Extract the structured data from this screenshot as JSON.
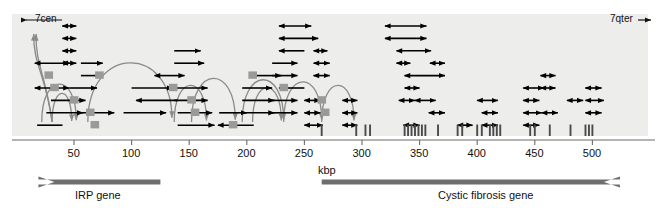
{
  "figure": {
    "panel": {
      "background_color": "#ededec",
      "x": 12,
      "y": 14,
      "width": 636,
      "height": 122
    },
    "orientation_labels": {
      "left": {
        "text": "7cen",
        "arrow": "left-arrow-icon"
      },
      "right": {
        "text": "7qter",
        "arrow": "right-arrow-icon"
      }
    },
    "axis": {
      "label": "kbp",
      "ticks": [
        50,
        100,
        150,
        200,
        250,
        300,
        350,
        400,
        450,
        500
      ],
      "tick_labels": [
        "50",
        "100",
        "150",
        "200",
        "250",
        "300",
        "350",
        "400",
        "450",
        "500"
      ],
      "range_kbp": [
        14,
        515
      ],
      "px_per_kbp": 1.152,
      "origin_px": 16.4,
      "line_color": "#6b6b6b",
      "y_px": 140
    },
    "genes": [
      {
        "name": "IRP gene",
        "label": "IRP gene",
        "direction": "left",
        "start_kbp": 33,
        "end_kbp": 125,
        "color": "#6e6e6e"
      },
      {
        "name": "Cystic fibrosis gene",
        "label": "Cystic fibrosis gene",
        "direction": "right",
        "start_kbp": 265,
        "end_kbp": 510,
        "color": "#6e6e6e"
      }
    ],
    "colors": {
      "clone_arrow": "#000000",
      "walk_arc": "#8a8a8a",
      "probe_box": "#9a9a9a",
      "exon_tick": "#4a4a4a",
      "panel_bg": "#ededec",
      "axis_line": "#6b6b6b",
      "gene_bar": "#6e6e6e"
    },
    "legend_semantics": {
      "clone_arrow": "cloned genomic fragment (double-headed arrow)",
      "walk_arc": "chromosome walk / jump step",
      "probe_box": "hybridization probe position",
      "exon_tick": "CFTR exon position"
    },
    "exon_ticks_kbp": [
      265,
      295,
      303,
      307,
      337,
      340,
      343,
      346,
      349,
      352,
      355,
      366,
      383,
      387,
      400,
      404,
      411,
      414,
      417,
      420,
      446,
      450,
      463,
      481,
      494,
      497,
      500
    ],
    "clones": [
      {
        "start_kbp": 16,
        "end_kbp": 46,
        "row": 3,
        "heads": "both"
      },
      {
        "start_kbp": 40,
        "end_kbp": 52,
        "row": 0,
        "heads": "both"
      },
      {
        "start_kbp": 40,
        "end_kbp": 52,
        "row": 1,
        "heads": "both"
      },
      {
        "start_kbp": 40,
        "end_kbp": 52,
        "row": 2,
        "heads": "both"
      },
      {
        "start_kbp": 40,
        "end_kbp": 52,
        "row": 3,
        "heads": "both"
      },
      {
        "start_kbp": 56,
        "end_kbp": 75,
        "row": 3,
        "heads": "right"
      },
      {
        "start_kbp": 56,
        "end_kbp": 75,
        "row": 4,
        "heads": "right"
      },
      {
        "start_kbp": 16,
        "end_kbp": 46,
        "row": 5,
        "heads": "both"
      },
      {
        "start_kbp": 46,
        "end_kbp": 70,
        "row": 5,
        "heads": "right"
      },
      {
        "start_kbp": 30,
        "end_kbp": 60,
        "row": 6,
        "heads": "right"
      },
      {
        "start_kbp": 26,
        "end_kbp": 58,
        "row": 7,
        "heads": "right"
      },
      {
        "start_kbp": 56,
        "end_kbp": 85,
        "row": 7,
        "heads": "right"
      },
      {
        "start_kbp": 18,
        "end_kbp": 40,
        "row": 8,
        "heads": "none"
      },
      {
        "start_kbp": 120,
        "end_kbp": 146,
        "row": 4,
        "heads": "both"
      },
      {
        "start_kbp": 100,
        "end_kbp": 136,
        "row": 5,
        "heads": "right"
      },
      {
        "start_kbp": 104,
        "end_kbp": 140,
        "row": 6,
        "heads": "left"
      },
      {
        "start_kbp": 93,
        "end_kbp": 130,
        "row": 7,
        "heads": "right"
      },
      {
        "start_kbp": 137,
        "end_kbp": 160,
        "row": 2,
        "heads": "right"
      },
      {
        "start_kbp": 137,
        "end_kbp": 163,
        "row": 3,
        "heads": "right"
      },
      {
        "start_kbp": 137,
        "end_kbp": 166,
        "row": 5,
        "heads": "right"
      },
      {
        "start_kbp": 137,
        "end_kbp": 166,
        "row": 6,
        "heads": "right"
      },
      {
        "start_kbp": 140,
        "end_kbp": 170,
        "row": 7,
        "heads": "right"
      },
      {
        "start_kbp": 140,
        "end_kbp": 172,
        "row": 8,
        "heads": "right"
      },
      {
        "start_kbp": 176,
        "end_kbp": 200,
        "row": 7,
        "heads": "right"
      },
      {
        "start_kbp": 175,
        "end_kbp": 206,
        "row": 8,
        "heads": "left"
      },
      {
        "start_kbp": 205,
        "end_kbp": 230,
        "row": 4,
        "heads": "right"
      },
      {
        "start_kbp": 196,
        "end_kbp": 222,
        "row": 5,
        "heads": "right"
      },
      {
        "start_kbp": 196,
        "end_kbp": 224,
        "row": 6,
        "heads": "right"
      },
      {
        "start_kbp": 196,
        "end_kbp": 224,
        "row": 7,
        "heads": "right"
      },
      {
        "start_kbp": 228,
        "end_kbp": 256,
        "row": 0,
        "heads": "both"
      },
      {
        "start_kbp": 228,
        "end_kbp": 262,
        "row": 1,
        "heads": "both"
      },
      {
        "start_kbp": 228,
        "end_kbp": 250,
        "row": 2,
        "heads": "left"
      },
      {
        "start_kbp": 258,
        "end_kbp": 270,
        "row": 2,
        "heads": "both"
      },
      {
        "start_kbp": 222,
        "end_kbp": 244,
        "row": 3,
        "heads": "right"
      },
      {
        "start_kbp": 258,
        "end_kbp": 272,
        "row": 3,
        "heads": "both"
      },
      {
        "start_kbp": 222,
        "end_kbp": 244,
        "row": 4,
        "heads": "right"
      },
      {
        "start_kbp": 258,
        "end_kbp": 272,
        "row": 4,
        "heads": "both"
      },
      {
        "start_kbp": 228,
        "end_kbp": 250,
        "row": 5,
        "heads": "left"
      },
      {
        "start_kbp": 222,
        "end_kbp": 244,
        "row": 6,
        "heads": "right"
      },
      {
        "start_kbp": 250,
        "end_kbp": 264,
        "row": 6,
        "heads": "both"
      },
      {
        "start_kbp": 250,
        "end_kbp": 264,
        "row": 7,
        "heads": "both"
      },
      {
        "start_kbp": 222,
        "end_kbp": 244,
        "row": 7,
        "heads": "right"
      },
      {
        "start_kbp": 250,
        "end_kbp": 266,
        "row": 8,
        "heads": "both"
      },
      {
        "start_kbp": 283,
        "end_kbp": 296,
        "row": 6,
        "heads": "both"
      },
      {
        "start_kbp": 283,
        "end_kbp": 296,
        "row": 7,
        "heads": "both"
      },
      {
        "start_kbp": 283,
        "end_kbp": 296,
        "row": 8,
        "heads": "both"
      },
      {
        "start_kbp": 320,
        "end_kbp": 356,
        "row": 0,
        "heads": "both"
      },
      {
        "start_kbp": 320,
        "end_kbp": 356,
        "row": 1,
        "heads": "both"
      },
      {
        "start_kbp": 330,
        "end_kbp": 360,
        "row": 2,
        "heads": "both"
      },
      {
        "start_kbp": 330,
        "end_kbp": 342,
        "row": 3,
        "heads": "both"
      },
      {
        "start_kbp": 359,
        "end_kbp": 372,
        "row": 3,
        "heads": "both"
      },
      {
        "start_kbp": 337,
        "end_kbp": 372,
        "row": 4,
        "heads": "both"
      },
      {
        "start_kbp": 337,
        "end_kbp": 350,
        "row": 5,
        "heads": "both"
      },
      {
        "start_kbp": 332,
        "end_kbp": 346,
        "row": 6,
        "heads": "both"
      },
      {
        "start_kbp": 346,
        "end_kbp": 364,
        "row": 6,
        "heads": "both"
      },
      {
        "start_kbp": 358,
        "end_kbp": 372,
        "row": 7,
        "heads": "both"
      },
      {
        "start_kbp": 336,
        "end_kbp": 350,
        "row": 8,
        "heads": "both"
      },
      {
        "start_kbp": 383,
        "end_kbp": 396,
        "row": 8,
        "heads": "both"
      },
      {
        "start_kbp": 400,
        "end_kbp": 418,
        "row": 6,
        "heads": "both"
      },
      {
        "start_kbp": 404,
        "end_kbp": 418,
        "row": 7,
        "heads": "both"
      },
      {
        "start_kbp": 404,
        "end_kbp": 418,
        "row": 8,
        "heads": "both"
      },
      {
        "start_kbp": 440,
        "end_kbp": 458,
        "row": 5,
        "heads": "both"
      },
      {
        "start_kbp": 440,
        "end_kbp": 454,
        "row": 6,
        "heads": "both"
      },
      {
        "start_kbp": 440,
        "end_kbp": 456,
        "row": 7,
        "heads": "both"
      },
      {
        "start_kbp": 456,
        "end_kbp": 470,
        "row": 7,
        "heads": "both"
      },
      {
        "start_kbp": 440,
        "end_kbp": 454,
        "row": 8,
        "heads": "both"
      },
      {
        "start_kbp": 455,
        "end_kbp": 468,
        "row": 4,
        "heads": "both"
      },
      {
        "start_kbp": 455,
        "end_kbp": 468,
        "row": 5,
        "heads": "both"
      },
      {
        "start_kbp": 478,
        "end_kbp": 492,
        "row": 6,
        "heads": "both"
      },
      {
        "start_kbp": 494,
        "end_kbp": 508,
        "row": 5,
        "heads": "both"
      },
      {
        "start_kbp": 494,
        "end_kbp": 510,
        "row": 6,
        "heads": "both"
      },
      {
        "start_kbp": 494,
        "end_kbp": 508,
        "row": 7,
        "heads": "both"
      }
    ],
    "walks": [
      {
        "from_kbp": 31,
        "to_kbp": 16,
        "kind": "arc-left-up"
      },
      {
        "from_kbp": 31,
        "to_kbp": 18,
        "kind": "arc-left-up"
      },
      {
        "from_kbp": 31,
        "to_kbp": 48,
        "kind": "arc-right"
      },
      {
        "from_kbp": 22,
        "to_kbp": 52,
        "kind": "arc-right"
      },
      {
        "from_kbp": 62,
        "to_kbp": 135,
        "kind": "arc-right-long"
      },
      {
        "from_kbp": 137,
        "to_kbp": 165,
        "kind": "arc-right"
      },
      {
        "from_kbp": 152,
        "to_kbp": 190,
        "kind": "arc-right"
      },
      {
        "from_kbp": 196,
        "to_kbp": 232,
        "kind": "arc-right"
      },
      {
        "from_kbp": 205,
        "to_kbp": 230,
        "kind": "arc-right"
      },
      {
        "from_kbp": 232,
        "to_kbp": 265,
        "kind": "arc-right"
      },
      {
        "from_kbp": 265,
        "to_kbp": 293,
        "kind": "arc-right"
      }
    ],
    "probes_kbp": [
      28,
      33,
      50,
      64,
      68,
      72,
      136,
      152,
      155,
      188,
      205,
      232,
      265,
      268
    ]
  }
}
